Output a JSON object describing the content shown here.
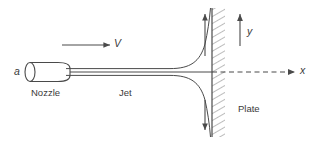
{
  "figure": {
    "width": 316,
    "height": 145,
    "background_color": "#ffffff",
    "line_color": "#4a4a4a",
    "text_color": "#3a3a3a"
  },
  "labels": {
    "nozzle_diameter": "a",
    "nozzle": "Nozzle",
    "jet": "Jet",
    "velocity": "V",
    "axis_y": "y",
    "axis_x": "x",
    "plate": "Plate"
  },
  "icons": {
    "velocity_arrow": "arrow-right-icon",
    "y_axis_arrow": "arrow-up-icon",
    "x_axis_arrow": "arrow-right-dashed-icon",
    "upward_flow_arrow": "arrow-up-icon",
    "downward_flow_arrow": "arrow-down-icon"
  },
  "geometry": {
    "centerline_y": 72,
    "nozzle": {
      "left_x": 25,
      "right_x": 70,
      "top_y": 63,
      "bottom_y": 82,
      "mouth_ellipse_rx": 5,
      "mouth_ellipse_ry": 9.5
    },
    "jet": {
      "start_x": 70,
      "half_width": 3.5,
      "impingement_x": 212
    },
    "plate": {
      "face_x": 212,
      "thickness": 13,
      "top_y": 8,
      "bottom_y": 137,
      "hatch_angle_deg": 60
    },
    "velocity_arrow": {
      "x1": 62,
      "x2": 110,
      "y": 45
    },
    "y_axis_arrow": {
      "x": 240,
      "y1": 45,
      "y2": 13
    },
    "x_axis_arrow": {
      "x1": 212,
      "x2": 296,
      "y": 72,
      "dashed": true
    },
    "flow_up_arrow": {
      "x": 205,
      "y1": 55,
      "y2": 13
    },
    "flow_down_arrow": {
      "x": 205,
      "y1": 100,
      "y2": 131
    }
  }
}
